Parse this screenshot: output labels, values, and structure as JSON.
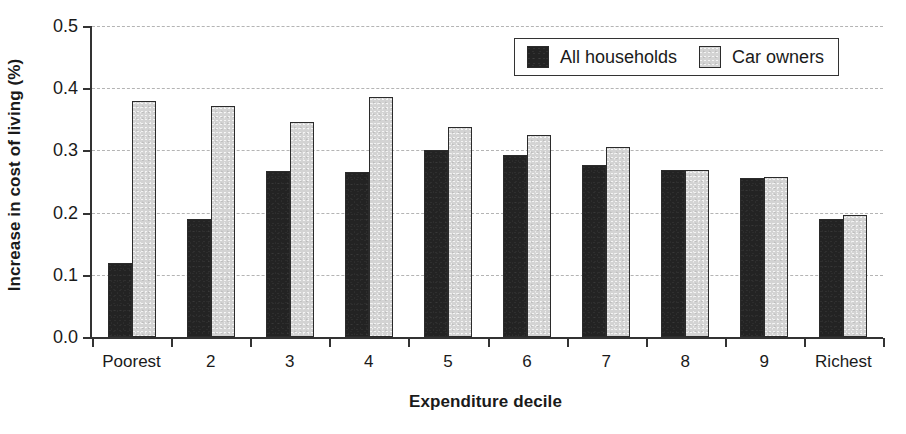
{
  "chart_data": {
    "type": "bar",
    "title": "",
    "xlabel": "Expenditure decile",
    "ylabel": "Increase in cost of living (%)",
    "categories": [
      "Poorest",
      "2",
      "3",
      "4",
      "5",
      "6",
      "7",
      "8",
      "9",
      "Richest"
    ],
    "series": [
      {
        "name": "All households",
        "color": "#232323",
        "values": [
          0.119,
          0.19,
          0.267,
          0.265,
          0.301,
          0.293,
          0.277,
          0.269,
          0.256,
          0.19
        ]
      },
      {
        "name": "Car owners",
        "color": "#d3d3d3",
        "values": [
          0.379,
          0.372,
          0.346,
          0.386,
          0.337,
          0.324,
          0.305,
          0.268,
          0.258,
          0.196
        ]
      }
    ],
    "ylim": [
      0.0,
      0.5
    ],
    "ytick_values": [
      0.0,
      0.1,
      0.2,
      0.3,
      0.4,
      0.5
    ],
    "ytick_labels": [
      "0.0",
      "0.1",
      "0.2",
      "0.3",
      "0.4",
      "0.5"
    ],
    "grid": "horizontal-dashed",
    "legend_position": "top-right-inside"
  },
  "legend": {
    "entries": [
      {
        "label": "All households",
        "swatch": "dark-swatch-icon"
      },
      {
        "label": "Car owners",
        "swatch": "light-swatch-icon"
      }
    ]
  }
}
